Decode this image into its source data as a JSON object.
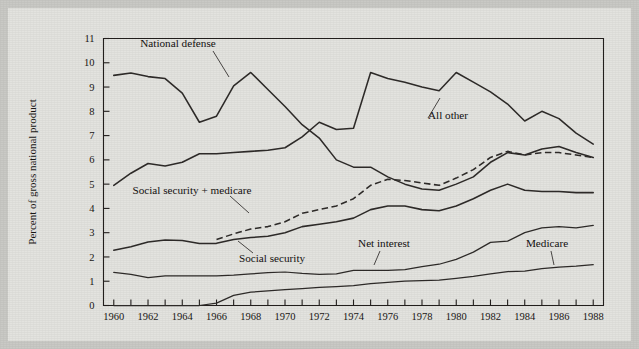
{
  "figure": {
    "background_color": "#e3e3df",
    "page_color": "#c9c9c5",
    "ink_color": "#2e2b29"
  },
  "axes": {
    "y_axis_title": "Percent of gross national product",
    "y_ticks": [
      "0",
      "1",
      "2",
      "3",
      "4",
      "5",
      "6",
      "7",
      "8",
      "9",
      "10",
      "11"
    ],
    "x_ticks_labeled": [
      "1960",
      "1962",
      "1964",
      "1966",
      "1968",
      "1970",
      "1972",
      "1974",
      "1976",
      "1978",
      "1980",
      "1982",
      "1984",
      "1986",
      "1988"
    ],
    "x_label": ""
  },
  "annotations": {
    "national_defense": "National defense",
    "all_other": "All other",
    "social_security_medicare": "Social security + medicare",
    "social_security": "Social security",
    "net_interest": "Net interest",
    "medicare": "Medicare"
  },
  "chart_data": {
    "type": "line",
    "title": "",
    "subtitle": "",
    "xlabel": "",
    "ylabel": "Percent of gross national product",
    "xlim": [
      1959.4,
      1988.6
    ],
    "ylim": [
      0,
      11
    ],
    "grid": false,
    "legend": "inline-annotations",
    "x": [
      1960,
      1961,
      1962,
      1963,
      1964,
      1965,
      1966,
      1967,
      1968,
      1969,
      1970,
      1971,
      1972,
      1973,
      1974,
      1975,
      1976,
      1977,
      1978,
      1979,
      1980,
      1981,
      1982,
      1983,
      1984,
      1985,
      1986,
      1987,
      1988
    ],
    "series": [
      {
        "name": "National defense",
        "style": "solid",
        "values": [
          9.48,
          9.58,
          9.43,
          9.35,
          8.75,
          7.55,
          7.8,
          9.05,
          9.6,
          8.9,
          8.2,
          7.45,
          6.9,
          6.0,
          5.7,
          5.7,
          5.3,
          5.0,
          4.8,
          4.75,
          5.0,
          5.3,
          5.9,
          6.3,
          6.2,
          6.45,
          6.55,
          6.3,
          6.1
        ]
      },
      {
        "name": "All other",
        "style": "solid",
        "values": [
          4.95,
          5.45,
          5.85,
          5.75,
          5.9,
          6.25,
          6.25,
          6.3,
          6.35,
          6.4,
          6.5,
          6.95,
          7.55,
          7.25,
          7.3,
          9.6,
          9.35,
          9.2,
          9.0,
          8.85,
          9.6,
          9.2,
          8.8,
          8.3,
          7.6,
          8.0,
          7.7,
          7.1,
          6.65
        ]
      },
      {
        "name": "Social security + medicare",
        "style": "dashed",
        "values": [
          null,
          null,
          null,
          null,
          null,
          null,
          2.72,
          2.95,
          3.15,
          3.25,
          3.45,
          3.8,
          3.95,
          4.1,
          4.4,
          4.95,
          5.2,
          5.15,
          5.05,
          4.95,
          5.25,
          5.6,
          6.1,
          6.35,
          6.2,
          6.3,
          6.3,
          6.2,
          6.1
        ]
      },
      {
        "name": "Social security",
        "style": "solid",
        "values": [
          2.28,
          2.42,
          2.62,
          2.7,
          2.68,
          2.55,
          2.56,
          2.72,
          2.8,
          2.85,
          3.0,
          3.25,
          3.35,
          3.45,
          3.6,
          3.95,
          4.1,
          4.1,
          3.95,
          3.9,
          4.1,
          4.4,
          4.75,
          5.0,
          4.75,
          4.7,
          4.7,
          4.65,
          4.65
        ]
      },
      {
        "name": "Net interest",
        "style": "solid",
        "values": [
          1.36,
          1.28,
          1.15,
          1.22,
          1.22,
          1.22,
          1.22,
          1.25,
          1.3,
          1.35,
          1.38,
          1.32,
          1.28,
          1.3,
          1.45,
          1.45,
          1.45,
          1.48,
          1.6,
          1.7,
          1.9,
          2.2,
          2.6,
          2.65,
          3.0,
          3.2,
          3.25,
          3.2,
          3.3
        ]
      },
      {
        "name": "Medicare",
        "style": "solid",
        "values": [
          0,
          0,
          0,
          0,
          0,
          0,
          0.1,
          0.42,
          0.55,
          0.6,
          0.65,
          0.7,
          0.75,
          0.78,
          0.82,
          0.9,
          0.95,
          1.0,
          1.02,
          1.05,
          1.12,
          1.2,
          1.3,
          1.4,
          1.42,
          1.52,
          1.58,
          1.62,
          1.68
        ]
      }
    ]
  }
}
